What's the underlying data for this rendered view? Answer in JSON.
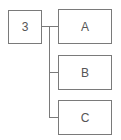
{
  "diagram": {
    "type": "tree",
    "root": {
      "label": "3"
    },
    "children": [
      {
        "label": "A"
      },
      {
        "label": "B"
      },
      {
        "label": "C"
      }
    ],
    "colors": {
      "stroke": "#7a7a7a",
      "text": "#555555",
      "background": "#ffffff"
    }
  }
}
